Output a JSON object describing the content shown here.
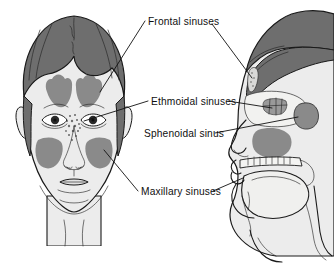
{
  "figure": {
    "background_color": "#ffffff",
    "width": 334,
    "height": 273
  },
  "palette": {
    "hair": "#6e6e6e",
    "hair_dark": "#5a5a5a",
    "skin": "#ececec",
    "skin_shadow": "#dcdcdc",
    "sinus_gray": "#8a8a8a",
    "sinus_gray_dark": "#7b7b7b",
    "bone_light": "#e4e4e2",
    "cavity": "#f4f4f2",
    "outline": "#1a1a1a",
    "text": "#101010"
  },
  "labels": [
    {
      "id": "frontal-sinuses",
      "text": "Frontal sinuses",
      "x": 148,
      "y": 21
    },
    {
      "id": "ethmoidal-sinuses",
      "text": "Ethmoidal sinuses",
      "x": 151,
      "y": 104
    },
    {
      "id": "sphenoidal-sinus",
      "text": "Sphenoidal sinus",
      "x": 144,
      "y": 136
    },
    {
      "id": "maxillary-sinuses",
      "text": "Maxillary sinuses",
      "x": 141,
      "y": 194
    }
  ],
  "views": {
    "anterior": {
      "name": "anterior-face-view",
      "description": "Front view of a head showing frontal, ethmoidal and maxillary sinuses shaded in gray"
    },
    "sagittal": {
      "name": "sagittal-head-view",
      "description": "Mid-sagittal section of a head showing frontal, ethmoidal, sphenoidal sinuses and nasal cavity"
    }
  },
  "caption": {
    "fragment": ""
  }
}
